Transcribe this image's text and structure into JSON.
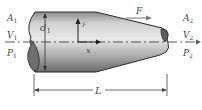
{
  "diagram": {
    "type": "nozzle-flow-schematic",
    "labels": {
      "inlet": [
        {
          "symbol": "A",
          "subscript": "1"
        },
        {
          "symbol": "V",
          "subscript": "1"
        },
        {
          "symbol": "P",
          "subscript": "1"
        }
      ],
      "outlet": [
        {
          "symbol": "A",
          "subscript": "2"
        },
        {
          "symbol": "V",
          "subscript": "2"
        },
        {
          "symbol": "P",
          "subscript": "2"
        }
      ],
      "diameter": {
        "symbol": "d",
        "subscript": "1"
      },
      "force": {
        "symbol": "F"
      },
      "axis_x": {
        "symbol": "x"
      },
      "axis_y": {
        "symbol": "F"
      },
      "length": {
        "symbol": "L"
      }
    },
    "colors": {
      "body_light": "#e6e6e6",
      "body_mid": "#b5b5b5",
      "body_dark": "#5a5a5a",
      "end_cap": "#6e6e6e",
      "outline": "#2a2a2a",
      "line": "#555555",
      "text": "#4a4a4a"
    }
  }
}
